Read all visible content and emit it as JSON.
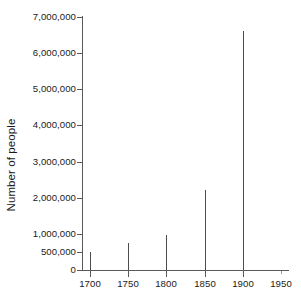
{
  "chart_data": {
    "type": "bar",
    "title": "",
    "subtitle": "",
    "xlabel": "",
    "ylabel": "Number of people",
    "categories": [
      1700,
      1750,
      1800,
      1850,
      1900
    ],
    "values": [
      500000,
      750000,
      980000,
      2200000,
      6600000
    ],
    "x": [
      1700,
      1750,
      1800,
      1850,
      1900
    ],
    "xlim": [
      1690,
      1960
    ],
    "ylim": [
      0,
      7000000
    ],
    "grid": false,
    "legend": false,
    "legend_position": "none",
    "series": [
      {
        "name": "Number of people",
        "values": [
          500000,
          750000,
          980000,
          2200000,
          6600000
        ]
      }
    ],
    "x_tick_labels": [
      "1700",
      "1750",
      "1800",
      "1850",
      "1900",
      "1950"
    ],
    "x_tick_values": [
      1700,
      1750,
      1800,
      1850,
      1900,
      1950
    ],
    "y_tick_labels": [
      "7,000,000",
      "6,000,000",
      "5,000,000",
      "4,000,000",
      "3,000,000",
      "2,000,000",
      "1,000,000",
      "500,000",
      "0"
    ],
    "y_tick_values": [
      7000000,
      6000000,
      5000000,
      4000000,
      3000000,
      2000000,
      1000000,
      500000,
      0
    ],
    "colors": {
      "bar": "#4d4d4d",
      "axis": "#5a5a5a",
      "text": "#1a1a1a",
      "background": "#ffffff"
    }
  }
}
